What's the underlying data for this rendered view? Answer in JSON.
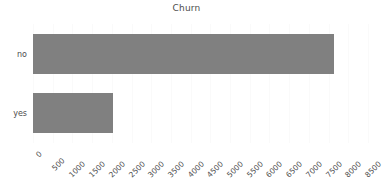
{
  "chart_data": {
    "type": "bar",
    "orientation": "horizontal",
    "title": "Churn",
    "xlabel": "",
    "ylabel": "",
    "categories": [
      "no",
      "yes"
    ],
    "values": [
      7640,
      2030
    ],
    "xlim": [
      0,
      8500
    ],
    "ylim": [
      0,
      2
    ],
    "xticks": [
      0,
      500,
      1000,
      1500,
      2000,
      2500,
      3000,
      3500,
      4000,
      4500,
      5000,
      5500,
      6000,
      6500,
      7000,
      7500,
      8000,
      8500
    ],
    "xtick_labels": [
      "0",
      "500",
      "1000",
      "1500",
      "2000",
      "2500",
      "3000",
      "3500",
      "4000",
      "4500",
      "5000",
      "5500",
      "6000",
      "6500",
      "7000",
      "7500",
      "8000",
      "8500"
    ],
    "xtick_rotation": -45,
    "grid": true,
    "grid_axis": "x",
    "legend": false,
    "bar_color": "#808080",
    "grid_color": "#fafafa",
    "text_color": "#4d4d4d",
    "background": "#ffffff",
    "series": [
      {
        "name": "Churn",
        "values": [
          7640,
          2030
        ]
      }
    ]
  }
}
